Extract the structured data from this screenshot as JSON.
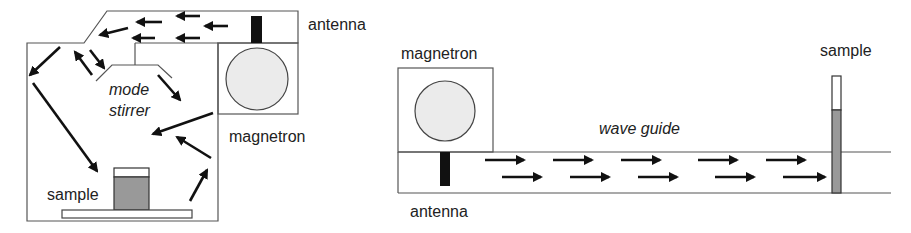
{
  "diagrams": [
    {
      "id": "multimode-cavity",
      "labels": {
        "antenna": "antenna",
        "magnetron": "magnetron",
        "mode_stirrer": [
          "mode",
          "stirrer"
        ],
        "sample": "sample"
      }
    },
    {
      "id": "single-mode-waveguide",
      "labels": {
        "magnetron": "magnetron",
        "wave_guide": "wave guide",
        "antenna": "antenna",
        "sample": "sample"
      }
    }
  ],
  "colors": {
    "outline": "#555555",
    "arrow": "#111111",
    "antenna": "#111111",
    "magnetron_fill": "#ebebeb",
    "sample_fill": "#999999"
  }
}
